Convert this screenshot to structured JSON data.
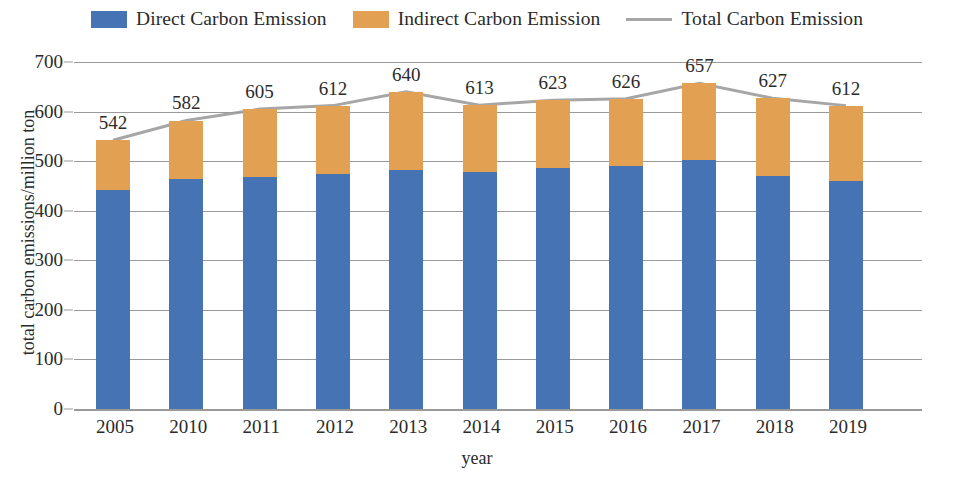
{
  "legend": {
    "items": [
      {
        "label": "Direct Carbon Emission",
        "marker": "swatch",
        "color": "#4573b4",
        "icon": "legend-swatch-blue"
      },
      {
        "label": "Indirect Carbon Emission",
        "marker": "swatch",
        "color": "#e2a053",
        "icon": "legend-swatch-orange"
      },
      {
        "label": "Total Carbon Emission",
        "marker": "line",
        "color": "#a6a6a6",
        "icon": "legend-line-gray"
      }
    ]
  },
  "chart_data": {
    "type": "bar",
    "subtype": "stacked-bar-with-line",
    "title": "",
    "xlabel": "year",
    "ylabel": "total carbon emissions/million ton",
    "categories": [
      "2005",
      "2010",
      "2011",
      "2012",
      "2013",
      "2014",
      "2015",
      "2016",
      "2017",
      "2018",
      "2019"
    ],
    "series": [
      {
        "name": "Direct Carbon Emission",
        "color": "#4573b4",
        "values": [
          442,
          463,
          469,
          474,
          483,
          479,
          486,
          490,
          502,
          470,
          460
        ]
      },
      {
        "name": "Indirect Carbon Emission",
        "color": "#e2a053",
        "values": [
          100,
          119,
          136,
          138,
          157,
          134,
          137,
          136,
          155,
          157,
          152
        ]
      },
      {
        "name": "Total Carbon Emission",
        "color": "#a6a6a6",
        "type": "line",
        "values": [
          542,
          582,
          605,
          612,
          640,
          613,
          623,
          626,
          657,
          627,
          612
        ]
      }
    ],
    "data_labels": [
      "542",
      "582",
      "605",
      "612",
      "640",
      "613",
      "623",
      "626",
      "657",
      "627",
      "612"
    ],
    "yticks": [
      0,
      100,
      200,
      300,
      400,
      500,
      600,
      700
    ],
    "ytick_labels": [
      "0",
      "100",
      "200",
      "300",
      "400",
      "500",
      "600",
      "700"
    ],
    "ylim": [
      0,
      700
    ],
    "grid": true,
    "legend_position": "top-center"
  }
}
